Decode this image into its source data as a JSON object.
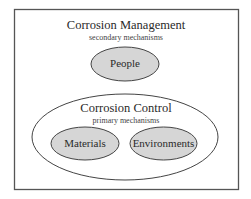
{
  "diagram": {
    "outer": {
      "title": "Corrosion Management",
      "subtitle": "secondary mechanisms",
      "node": "People"
    },
    "inner": {
      "title": "Corrosion Control",
      "subtitle": "primary mechanisms",
      "nodes": [
        "Materials",
        "Environments"
      ]
    }
  },
  "colors": {
    "frame": "#555555",
    "node_fill": "#d6d6d6",
    "stroke": "#444444",
    "background": "#ffffff"
  }
}
